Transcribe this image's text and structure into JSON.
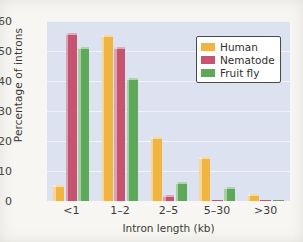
{
  "chart_data": {
    "type": "bar",
    "title": "",
    "xlabel": "Intron length (kb)",
    "ylabel": "Percentage of introns",
    "categories": [
      "<1",
      "1–2",
      "2–5",
      "5–30",
      ">30"
    ],
    "series": [
      {
        "name": "Human",
        "color": "#f0b441",
        "values": [
          5.5,
          55.5,
          21.5,
          14.8,
          2.2
        ]
      },
      {
        "name": "Nematode",
        "color": "#c4546f",
        "values": [
          56.0,
          51.5,
          2.0,
          0.5,
          0.2
        ]
      },
      {
        "name": "Fruit fly",
        "color": "#5ea85a",
        "values": [
          51.5,
          41.0,
          6.5,
          4.8,
          0.5
        ]
      }
    ],
    "ylim": [
      0,
      60
    ],
    "yticks": [
      0,
      10,
      20,
      30,
      40,
      50,
      60
    ],
    "ytick_labels": [
      "0",
      "10",
      "20",
      "30",
      "40",
      "50",
      "60"
    ],
    "grid": true,
    "grid_axis": "y",
    "legend_position": "upper right",
    "plot_background": "#dde2f1",
    "page_background": "#f7f6f3"
  },
  "legend": {
    "entries": [
      {
        "label": "Human"
      },
      {
        "label": "Nematode"
      },
      {
        "label": "Fruit fly"
      }
    ]
  }
}
